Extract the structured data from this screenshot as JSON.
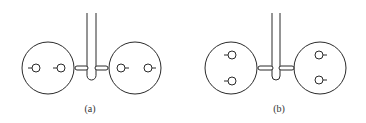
{
  "figure": {
    "panels": [
      {
        "id": "a",
        "label": "(a)",
        "label_pos": [
          90,
          103
        ],
        "description": "Two large discs connected by a U-shaped tube with horizontal coupling capsules; each disc has two small circles arranged horizontally",
        "large_circles": [
          {
            "cx": 48,
            "cy": 68,
            "r": 26
          },
          {
            "cx": 135,
            "cy": 68,
            "r": 26
          }
        ],
        "small_circles": [
          {
            "cx": 36,
            "cy": 68,
            "r": 4,
            "stub": "left"
          },
          {
            "cx": 61,
            "cy": 68,
            "r": 4,
            "stub": "left"
          },
          {
            "cx": 121,
            "cy": 68,
            "r": 4,
            "stub": "right"
          },
          {
            "cx": 148,
            "cy": 68,
            "r": 4,
            "stub": "right"
          }
        ],
        "tube": {
          "x_left": 87,
          "x_right": 96,
          "y_top": 13,
          "y_bottom": 80
        },
        "capsules": [
          {
            "x1": 75,
            "x2": 88,
            "cy": 68
          },
          {
            "x1": 95,
            "x2": 108,
            "cy": 68
          }
        ]
      },
      {
        "id": "b",
        "label": "(b)",
        "label_pos": [
          279,
          103
        ],
        "description": "Same setup as (a) but each disc has two small circles arranged vertically",
        "large_circles": [
          {
            "cx": 231,
            "cy": 68,
            "r": 26
          },
          {
            "cx": 320,
            "cy": 68,
            "r": 26
          }
        ],
        "small_circles": [
          {
            "cx": 232,
            "cy": 55,
            "r": 4,
            "stub": "left"
          },
          {
            "cx": 232,
            "cy": 81,
            "r": 4,
            "stub": "left"
          },
          {
            "cx": 319,
            "cy": 55,
            "r": 4,
            "stub": "right"
          },
          {
            "cx": 319,
            "cy": 80,
            "r": 4,
            "stub": "right"
          }
        ],
        "tube": {
          "x_left": 272,
          "x_right": 280,
          "y_top": 13,
          "y_bottom": 80
        },
        "capsules": [
          {
            "x1": 258,
            "x2": 273,
            "cy": 68
          },
          {
            "x1": 279,
            "x2": 294,
            "cy": 68
          }
        ]
      }
    ],
    "colors": {
      "line": "#2a2a2a",
      "background": "#ffffff",
      "text": "#333333"
    }
  }
}
